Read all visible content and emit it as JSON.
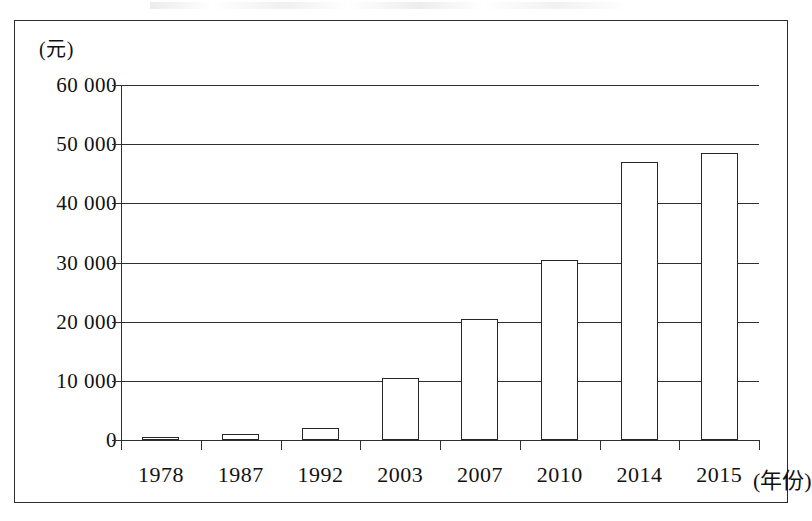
{
  "figure": {
    "y_unit_label": "(元)",
    "x_axis_title": "(年份)"
  },
  "chart_data": {
    "type": "bar",
    "title": "",
    "subtitle": "",
    "xlabel": "(年份)",
    "ylabel": "(元)",
    "categories": [
      "1978",
      "1987",
      "1992",
      "2003",
      "2007",
      "2010",
      "2014",
      "2015"
    ],
    "values": [
      343,
      1000,
      2000,
      10500,
      20400,
      30500,
      47000,
      48500
    ],
    "ytick_labels": [
      "0",
      "10 000",
      "20 000",
      "30 000",
      "40 000",
      "50 000",
      "60 000"
    ],
    "ytick_values": [
      0,
      10000,
      20000,
      30000,
      40000,
      50000,
      60000
    ],
    "ylim": [
      0,
      60000
    ],
    "grid": "horizontal",
    "legend": "none",
    "bar_style": "hollow-outline",
    "series": [
      {
        "name": "",
        "values": [
          343,
          1000,
          2000,
          10500,
          20400,
          30500,
          47000,
          48500
        ]
      }
    ]
  }
}
